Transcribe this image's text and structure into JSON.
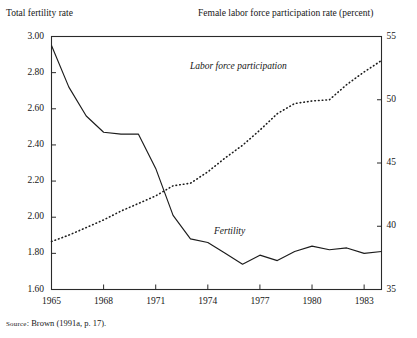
{
  "figure": {
    "left_axis_title": "Total fertility rate",
    "right_axis_title": "Female labor force participation rate (percent)",
    "source_prefix": "Source",
    "source_text": ": Brown (1991a, p. 17)."
  },
  "chart_data": {
    "type": "line",
    "title": "",
    "xlabel": "",
    "ylabel": "Total fertility rate",
    "y2label": "Female labor force participation rate (percent)",
    "grid": false,
    "legend_position": "inline-annotation",
    "xlim": [
      1965,
      1984
    ],
    "ylim": [
      1.6,
      3.0
    ],
    "y2lim": [
      35,
      55
    ],
    "xticks": [
      1965,
      1968,
      1971,
      1974,
      1977,
      1980,
      1983
    ],
    "xtick_labels": [
      "1965",
      "1968",
      "1971",
      "1974",
      "1977",
      "1980",
      "1983"
    ],
    "yticks": [
      1.6,
      1.8,
      2.0,
      2.2,
      2.4,
      2.6,
      2.8,
      3.0
    ],
    "ytick_labels": [
      "1.60",
      "1.80",
      "2.00",
      "2.20",
      "2.40",
      "2.60",
      "2.80",
      "3.00"
    ],
    "y2ticks": [
      35,
      40,
      45,
      50,
      55
    ],
    "y2tick_labels": [
      "35",
      "40",
      "45",
      "50",
      "55"
    ],
    "x": [
      1965,
      1966,
      1967,
      1968,
      1969,
      1970,
      1971,
      1972,
      1973,
      1974,
      1975,
      1976,
      1977,
      1978,
      1979,
      1980,
      1981,
      1982,
      1983,
      1984
    ],
    "series": [
      {
        "name": "Fertility",
        "axis": "left",
        "style": "solid",
        "annotation": "Fertility",
        "values": [
          2.95,
          2.72,
          2.56,
          2.47,
          2.46,
          2.46,
          2.27,
          2.01,
          1.88,
          1.86,
          1.8,
          1.74,
          1.79,
          1.76,
          1.81,
          1.84,
          1.82,
          1.83,
          1.8,
          1.81
        ]
      },
      {
        "name": "Labor force participation",
        "axis": "right",
        "style": "dotted",
        "annotation": "Labor force participation",
        "values": [
          38.8,
          39.3,
          39.9,
          40.5,
          41.2,
          41.8,
          42.4,
          43.2,
          43.4,
          44.3,
          45.4,
          46.4,
          47.6,
          48.9,
          49.7,
          49.9,
          50.0,
          51.2,
          52.2,
          53.1
        ]
      }
    ]
  }
}
